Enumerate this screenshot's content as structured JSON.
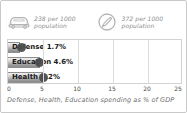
{
  "stats": [
    {
      "icon": "car-icon",
      "value": "238",
      "text": "238 per 1000\npopulation"
    },
    {
      "icon": "telephone-circle-icon",
      "value": "372",
      "text": "372 per 1000\npopulation"
    }
  ],
  "caption": "Defense, Health, Education spending as % of GDP",
  "colors": {
    "bar_fill": "#9e9e9e",
    "bar_border": "#8f8f8f",
    "gridline": "#dcdcdc",
    "frame": "#c9c9c9",
    "text_muted": "#8c8c8c",
    "dot": "#4a4a4a"
  },
  "chart_data": {
    "type": "bar",
    "orientation": "horizontal",
    "title": "",
    "subtitle": "",
    "xlabel": "Defense, Health, Education spending as % of GDP",
    "ylabel": "",
    "categories": [
      "Defense",
      "Education",
      "Health"
    ],
    "values": [
      1.7,
      4.6,
      5.2
    ],
    "bar_labels": [
      "Defense 1.7%",
      "Education 4.6%",
      "Health 5.2%"
    ],
    "xlim": [
      0,
      25
    ],
    "ticks": [
      0,
      5,
      10,
      15,
      20,
      25
    ],
    "tick_labels": [
      "0",
      "5",
      "10",
      "15",
      "20",
      "25"
    ],
    "grid": true,
    "legend": "none"
  }
}
